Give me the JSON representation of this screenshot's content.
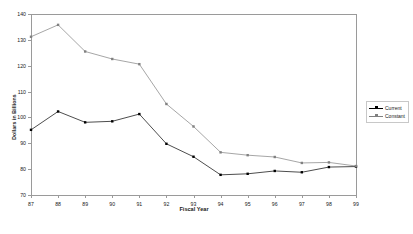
{
  "chart_data": {
    "type": "line",
    "title": "",
    "xlabel": "Fiscal Year",
    "ylabel": "Dollars in Billions",
    "categories": [
      "87",
      "88",
      "89",
      "90",
      "91",
      "92",
      "93",
      "94",
      "95",
      "96",
      "97",
      "98",
      "99"
    ],
    "xlim": [
      87,
      99
    ],
    "ylim": [
      70,
      140
    ],
    "yticks": [
      70,
      80,
      90,
      100,
      110,
      120,
      130,
      140
    ],
    "ytick_labels": [
      "70",
      "80",
      "90",
      "100",
      "110",
      "120",
      "130",
      "140"
    ],
    "grid": false,
    "legend_position": "right",
    "series": [
      {
        "name": "Current",
        "color": "#000000",
        "marker": "square",
        "values": [
          95.2,
          102.3,
          98.1,
          98.5,
          101.3,
          89.8,
          84.8,
          77.8,
          78.2,
          79.3,
          78.8,
          80.8,
          81.0
        ]
      },
      {
        "name": "Constant",
        "color": "#808080",
        "marker": "square",
        "values": [
          131.2,
          135.8,
          125.5,
          122.6,
          120.6,
          105.2,
          96.5,
          86.5,
          85.4,
          84.7,
          82.4,
          82.6,
          81.2
        ]
      }
    ]
  },
  "legend": {
    "entries": [
      "Current",
      "Constant"
    ]
  },
  "axes": {
    "x_title": "Fiscal Year",
    "y_title": "Dollars in Billions"
  },
  "colors": {
    "axis": "#9a9a9a",
    "text": "#1a1a1a",
    "series_current": "#000000",
    "series_constant": "#808080",
    "background": "#ffffff"
  }
}
